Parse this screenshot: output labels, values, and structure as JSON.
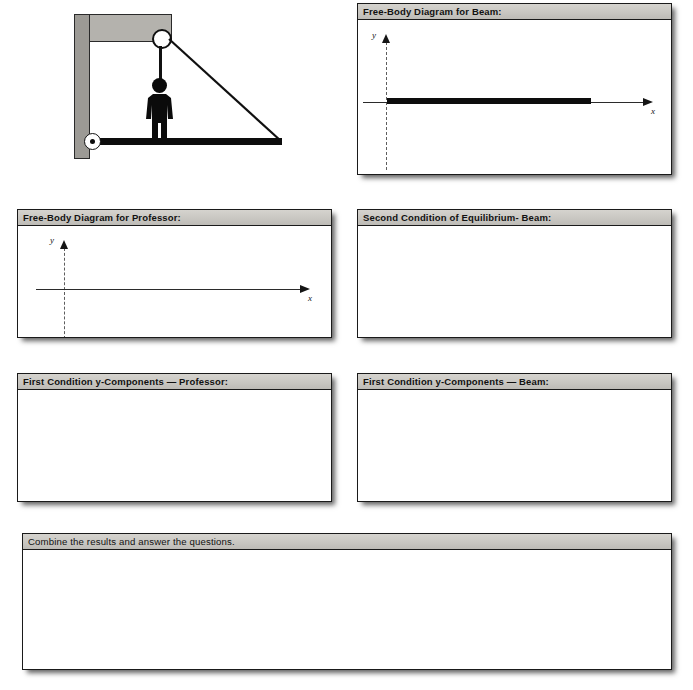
{
  "worksheet": {
    "title": "Statics worksheet — beam, pulley and professor",
    "illustration": {
      "name": "beam-pulley-professor-diagram",
      "parts": [
        "wall",
        "bracket",
        "pulley",
        "rope",
        "person",
        "beam",
        "cable",
        "pivot"
      ]
    },
    "panels": [
      {
        "id": "fbd-beam",
        "header": "Free-Body Diagram for Beam:",
        "bold": true,
        "axes": {
          "y_label": "y",
          "x_label": "x"
        },
        "has_beam": true
      },
      {
        "id": "fbd-professor",
        "header": "Free-Body Diagram for Professor:",
        "bold": true,
        "axes": {
          "y_label": "y",
          "x_label": "x"
        },
        "has_beam": false
      },
      {
        "id": "second-condition-beam",
        "header": "Second Condition of Equilibrium- Beam:",
        "bold": true,
        "axes": null,
        "has_beam": false
      },
      {
        "id": "first-condition-y-professor",
        "header": "First Condition y-Components — Professor:",
        "bold": true,
        "axes": null,
        "has_beam": false
      },
      {
        "id": "first-condition-y-beam",
        "header": "First Condition y-Components — Beam:",
        "bold": true,
        "axes": null,
        "has_beam": false
      },
      {
        "id": "combine-results",
        "header": "Combine the results and answer the questions.",
        "bold": false,
        "axes": null,
        "has_beam": false
      }
    ]
  },
  "colors": {
    "page_background": "#ffffff",
    "panel_border": "#1a1a1a",
    "panel_header_fill": "#c9c7c2",
    "ink": "#0d0d0d",
    "wall_fill": "#9c9a95",
    "bracket_fill": "#b4b2ad",
    "axis_dash": "#5d5d5d"
  }
}
